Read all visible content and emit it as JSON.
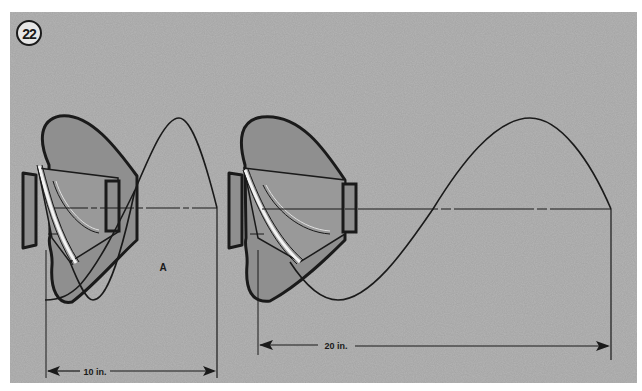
{
  "figure": {
    "number": "22",
    "background_color": "#b5b5b5",
    "line_color": "#1a1a1a",
    "propeller_fill": "#8f8f8f",
    "propeller_highlight": "#f2f2f2"
  },
  "panels": [
    {
      "id": "left",
      "label": "A",
      "pitch_dimension": "10 in."
    },
    {
      "id": "right",
      "pitch_dimension": "20 in."
    }
  ]
}
